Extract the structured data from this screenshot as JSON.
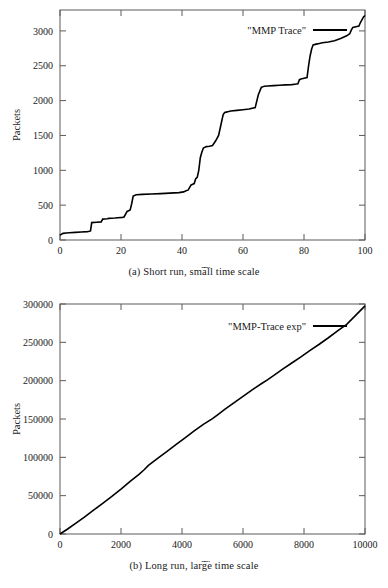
{
  "figure": {
    "panels": [
      {
        "id": "a",
        "caption": "(a) Short run, small time scale",
        "chart_data": {
          "type": "line",
          "title": "",
          "xlabel": "Time",
          "ylabel": "Packets",
          "legend": [
            "\"MMP Trace\""
          ],
          "legend_position": "top-right",
          "grid": false,
          "xlim": [
            0,
            100
          ],
          "ylim": [
            0,
            3300
          ],
          "xticks": [
            0,
            20,
            40,
            60,
            80,
            100
          ],
          "yticks": [
            0,
            500,
            1000,
            1500,
            2000,
            2500,
            3000
          ],
          "ytick_labels": [
            "0",
            "500",
            "1000",
            "1500",
            "2000",
            "2500",
            "3000"
          ],
          "xtick_labels": [
            "0",
            "20",
            "40",
            "60",
            "80",
            "100"
          ],
          "series": [
            {
              "name": "\"MMP Trace\"",
              "color": "#000000",
              "x": [
                0,
                1,
                2,
                3,
                5,
                7,
                9,
                9.6,
                10,
                10.4,
                12,
                13.5,
                14,
                15.5,
                16,
                18,
                19,
                20.5,
                21,
                22,
                22.5,
                23,
                23.5,
                24,
                25,
                27,
                30,
                33,
                36,
                39,
                40.5,
                41,
                41.5,
                42,
                43,
                43.5,
                44,
                44.5,
                45,
                45.5,
                46,
                46.5,
                47,
                48,
                49,
                50,
                51,
                52,
                53,
                53.5,
                54,
                54.5,
                55,
                56,
                58,
                60,
                62,
                64,
                65,
                66,
                66.5,
                67,
                68,
                70,
                72,
                74,
                76,
                77,
                78,
                78.5,
                79,
                80,
                81,
                81.5,
                82,
                82.5,
                83,
                84,
                85,
                86,
                88,
                90,
                92,
                94,
                95,
                95.5,
                96,
                97,
                98,
                98.5,
                99,
                99.5,
                100
              ],
              "y": [
                70,
                95,
                100,
                105,
                110,
                115,
                120,
                125,
                130,
                250,
                255,
                260,
                300,
                305,
                310,
                315,
                320,
                325,
                330,
                410,
                420,
                430,
                520,
                630,
                650,
                655,
                660,
                665,
                672,
                680,
                690,
                700,
                710,
                715,
                790,
                800,
                810,
                880,
                900,
                1000,
                1180,
                1260,
                1320,
                1340,
                1345,
                1355,
                1420,
                1500,
                1700,
                1800,
                1830,
                1835,
                1840,
                1850,
                1860,
                1870,
                1880,
                1900,
                2080,
                2190,
                2200,
                2205,
                2210,
                2215,
                2220,
                2225,
                2230,
                2235,
                2240,
                2300,
                2310,
                2320,
                2330,
                2500,
                2640,
                2740,
                2800,
                2810,
                2820,
                2830,
                2840,
                2860,
                2890,
                2930,
                2960,
                3010,
                3050,
                3060,
                3070,
                3120,
                3160,
                3200,
                3220
              ]
            }
          ]
        }
      },
      {
        "id": "b",
        "caption": "(b) Long run, large time scale",
        "chart_data": {
          "type": "line",
          "title": "",
          "xlabel": "Time",
          "ylabel": "Packets",
          "legend": [
            "\"MMP-Trace exp\""
          ],
          "legend_position": "top-right",
          "grid": false,
          "xlim": [
            0,
            10000
          ],
          "ylim": [
            0,
            300000
          ],
          "xticks": [
            0,
            2000,
            4000,
            6000,
            8000,
            10000
          ],
          "yticks": [
            0,
            50000,
            100000,
            150000,
            200000,
            250000,
            300000
          ],
          "ytick_labels": [
            "0",
            "50000",
            "100000",
            "150000",
            "200000",
            "250000",
            "300000"
          ],
          "xtick_labels": [
            "0",
            "2000",
            "4000",
            "6000",
            "8000",
            "10000"
          ],
          "series": [
            {
              "name": "\"MMP-Trace exp\"",
              "color": "#000000",
              "x": [
                0,
                250,
                500,
                800,
                1100,
                1400,
                1700,
                2000,
                2300,
                2600,
                2750,
                2900,
                3200,
                3500,
                3800,
                4100,
                4400,
                4700,
                5000,
                5200,
                5400,
                5700,
                6000,
                6300,
                6600,
                6800,
                7000,
                7300,
                7600,
                7900,
                8200,
                8500,
                8800,
                9100,
                9400,
                9700,
                10000
              ],
              "y": [
                0,
                6500,
                13500,
                22000,
                31000,
                40000,
                49000,
                58500,
                68500,
                78000,
                83500,
                89500,
                98500,
                107500,
                116500,
                125500,
                134500,
                143000,
                150500,
                156500,
                162500,
                171000,
                179500,
                188000,
                196000,
                201000,
                206500,
                215000,
                223000,
                231000,
                239500,
                247500,
                256000,
                265000,
                273500,
                285500,
                297500
              ]
            }
          ]
        }
      }
    ]
  }
}
